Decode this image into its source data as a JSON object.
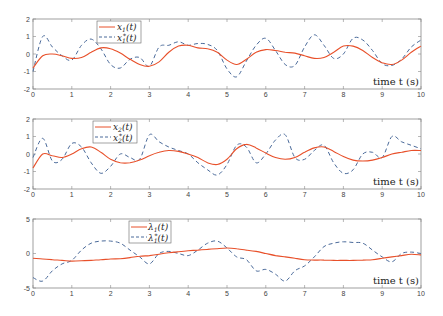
{
  "figure": {
    "xlabel": "time t (s)",
    "colors": {
      "actual": "#e8502a",
      "reference": "#4a6a9a",
      "axis": "#888888"
    }
  },
  "chart_data": [
    {
      "type": "line",
      "title": "",
      "xlabel": "time t (s)",
      "ylabel": "",
      "xlim": [
        0,
        10
      ],
      "ylim": [
        -2,
        2
      ],
      "xticks": [
        0,
        1,
        2,
        3,
        4,
        5,
        6,
        7,
        8,
        9,
        10
      ],
      "yticks": [
        -2,
        -1,
        0,
        1,
        2
      ],
      "grid": false,
      "legend_position": "upper-left-center",
      "x": [
        0,
        0.25,
        0.5,
        0.75,
        1,
        1.25,
        1.5,
        1.75,
        2,
        2.25,
        2.5,
        2.75,
        3,
        3.25,
        3.5,
        3.75,
        4,
        4.25,
        4.5,
        4.75,
        5,
        5.25,
        5.5,
        5.75,
        6,
        6.25,
        6.5,
        6.75,
        7,
        7.25,
        7.5,
        7.75,
        8,
        8.25,
        8.5,
        8.75,
        9,
        9.25,
        9.5,
        9.75,
        10
      ],
      "series": [
        {
          "name": "x1(t)",
          "style": "solid",
          "values": [
            -0.8,
            -0.1,
            0.0,
            -0.1,
            -0.25,
            -0.2,
            0.1,
            0.35,
            0.3,
            0.05,
            -0.3,
            -0.6,
            -0.7,
            -0.45,
            0.1,
            0.45,
            0.5,
            0.35,
            0.3,
            0.1,
            -0.35,
            -0.6,
            -0.3,
            0.1,
            0.25,
            0.2,
            0.1,
            0.05,
            -0.1,
            -0.25,
            -0.2,
            0.1,
            0.45,
            0.45,
            0.2,
            -0.2,
            -0.5,
            -0.6,
            -0.35,
            0.1,
            0.45
          ]
        },
        {
          "name": "x1*(t)",
          "style": "dashed",
          "values": [
            -1.0,
            1.0,
            0.4,
            -0.1,
            -0.35,
            0.5,
            0.85,
            0.3,
            -0.6,
            -0.8,
            -0.3,
            -0.2,
            -0.7,
            0.4,
            0.5,
            0.7,
            0.5,
            0.6,
            0.55,
            0.2,
            -0.85,
            -1.3,
            -0.4,
            0.5,
            0.9,
            0.2,
            -0.6,
            -0.65,
            0.4,
            1.1,
            0.5,
            -0.25,
            0.0,
            0.9,
            0.8,
            0.2,
            -0.55,
            -0.65,
            -0.3,
            0.4,
            0.8
          ]
        }
      ]
    },
    {
      "type": "line",
      "title": "",
      "xlabel": "time t (s)",
      "ylabel": "",
      "xlim": [
        0,
        10
      ],
      "ylim": [
        -2,
        2
      ],
      "xticks": [
        0,
        1,
        2,
        3,
        4,
        5,
        6,
        7,
        8,
        9,
        10
      ],
      "yticks": [
        -2,
        -1,
        0,
        1,
        2
      ],
      "grid": false,
      "legend_position": "upper-left-center",
      "x": [
        0,
        0.25,
        0.5,
        0.75,
        1,
        1.25,
        1.5,
        1.75,
        2,
        2.25,
        2.5,
        2.75,
        3,
        3.25,
        3.5,
        3.75,
        4,
        4.25,
        4.5,
        4.75,
        5,
        5.25,
        5.5,
        5.75,
        6,
        6.25,
        6.5,
        6.75,
        7,
        7.25,
        7.5,
        7.75,
        8,
        8.25,
        8.5,
        8.75,
        9,
        9.25,
        9.5,
        9.75,
        10
      ],
      "series": [
        {
          "name": "x2(t)",
          "style": "solid",
          "values": [
            -0.8,
            0.0,
            -0.1,
            -0.2,
            0.0,
            0.3,
            0.4,
            0.1,
            -0.3,
            -0.5,
            -0.5,
            -0.35,
            -0.1,
            0.1,
            0.2,
            0.15,
            0.0,
            -0.2,
            -0.5,
            -0.6,
            -0.3,
            0.3,
            0.55,
            0.35,
            0.05,
            -0.2,
            -0.3,
            -0.2,
            0.1,
            0.35,
            0.4,
            0.15,
            -0.15,
            -0.35,
            -0.4,
            -0.35,
            -0.2,
            0.0,
            0.1,
            0.2,
            0.2
          ]
        },
        {
          "name": "x2*(t)",
          "style": "dashed",
          "values": [
            -0.2,
            0.9,
            -0.4,
            -0.3,
            0.6,
            0.4,
            -0.5,
            -1.1,
            -0.7,
            0.0,
            -0.2,
            -0.3,
            1.1,
            0.7,
            0.4,
            0.2,
            0.0,
            -0.5,
            -0.9,
            -1.2,
            -0.6,
            0.5,
            0.4,
            -0.5,
            0.0,
            0.8,
            1.1,
            -0.2,
            -0.3,
            0.2,
            0.5,
            -0.5,
            -1.1,
            -0.9,
            0.0,
            0.1,
            -0.2,
            1.0,
            0.7,
            0.5,
            0.3
          ]
        }
      ]
    },
    {
      "type": "line",
      "title": "",
      "xlabel": "time t (s)",
      "ylabel": "",
      "xlim": [
        0,
        10
      ],
      "ylim": [
        -5,
        5
      ],
      "xticks": [
        0,
        1,
        2,
        3,
        4,
        5,
        6,
        7,
        8,
        9,
        10
      ],
      "yticks": [
        -5,
        0,
        5
      ],
      "grid": false,
      "legend_position": "upper-left-center",
      "x": [
        0,
        0.25,
        0.5,
        0.75,
        1,
        1.25,
        1.5,
        1.75,
        2,
        2.25,
        2.5,
        2.75,
        3,
        3.25,
        3.5,
        3.75,
        4,
        4.25,
        4.5,
        4.75,
        5,
        5.25,
        5.5,
        5.75,
        6,
        6.25,
        6.5,
        6.75,
        7,
        7.25,
        7.5,
        7.75,
        8,
        8.25,
        8.5,
        8.75,
        9,
        9.25,
        9.5,
        9.75,
        10
      ],
      "series": [
        {
          "name": "λ1(t)",
          "style": "solid",
          "values": [
            -0.7,
            -0.8,
            -0.9,
            -1.0,
            -1.1,
            -1.05,
            -1.0,
            -0.9,
            -0.8,
            -0.75,
            -0.6,
            -0.4,
            -0.3,
            -0.1,
            0.1,
            0.25,
            0.4,
            0.5,
            0.6,
            0.7,
            0.8,
            0.7,
            0.5,
            0.3,
            0.0,
            -0.3,
            -0.5,
            -0.7,
            -0.9,
            -0.95,
            -0.95,
            -1.0,
            -1.0,
            -1.0,
            -0.95,
            -0.9,
            -0.7,
            -0.5,
            -0.3,
            -0.1,
            -0.2
          ]
        },
        {
          "name": "λ1*(t)",
          "style": "dashed",
          "values": [
            -3.5,
            -4.0,
            -2.5,
            -1.5,
            -1.0,
            0.5,
            1.5,
            1.8,
            1.8,
            1.5,
            0.5,
            -0.5,
            -1.5,
            0.0,
            0.3,
            0.0,
            -0.3,
            0.5,
            1.5,
            1.8,
            0.8,
            -0.5,
            -0.9,
            -2.5,
            -2.3,
            -3.0,
            -4.0,
            -2.5,
            -1.8,
            -0.5,
            1.0,
            1.5,
            1.7,
            1.6,
            1.5,
            0.5,
            -0.5,
            -1.2,
            0.0,
            0.2,
            0.0
          ]
        }
      ]
    }
  ],
  "plots": [
    {
      "legend": {
        "line1": "x",
        "line1_sub": "1",
        "line1_suffix": "(t)",
        "line2": "x",
        "line2_sub": "1",
        "line2_sup": "*",
        "line2_suffix": "(t)"
      },
      "yticks": [
        "2",
        "1",
        "0",
        "-1",
        "-2"
      ],
      "xticks": [
        "0",
        "1",
        "2",
        "3",
        "4",
        "5",
        "6",
        "7",
        "8",
        "9",
        "10"
      ]
    },
    {
      "legend": {
        "line1": "x",
        "line1_sub": "2",
        "line1_suffix": "(t)",
        "line2": "x",
        "line2_sub": "2",
        "line2_sup": "*",
        "line2_suffix": "(t)"
      },
      "yticks": [
        "2",
        "1",
        "0",
        "-1",
        "-2"
      ],
      "xticks": [
        "0",
        "1",
        "2",
        "3",
        "4",
        "5",
        "6",
        "7",
        "8",
        "9",
        "10"
      ]
    },
    {
      "legend": {
        "line1": "λ",
        "line1_sub": "1",
        "line1_suffix": "(t)",
        "line2": "λ",
        "line2_sub": "1",
        "line2_sup": "*",
        "line2_suffix": "(t)"
      },
      "yticks": [
        "5",
        "0",
        "-5"
      ],
      "xticks": [
        "0",
        "1",
        "2",
        "3",
        "4",
        "5",
        "6",
        "7",
        "8",
        "9",
        "10"
      ]
    }
  ]
}
